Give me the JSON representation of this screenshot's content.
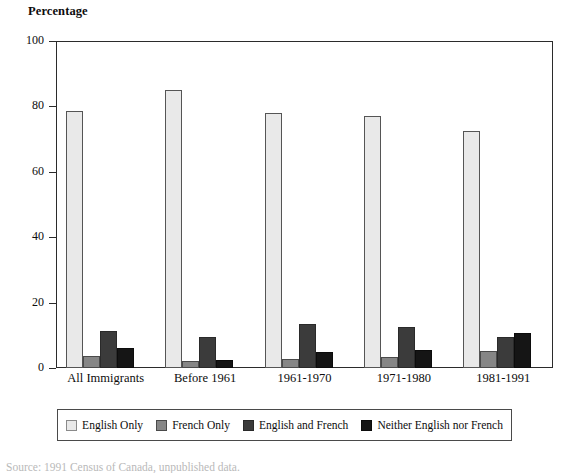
{
  "chart_data": {
    "type": "bar",
    "title": "",
    "ylabel": "Percentage",
    "xlabel": "",
    "ylim": [
      0,
      100
    ],
    "yticks": [
      0,
      20,
      40,
      60,
      80,
      100
    ],
    "grid": false,
    "legend_position": "bottom",
    "categories": [
      "All Immigrants",
      "Before 1961",
      "1961-1970",
      "1971-1980",
      "1981-1991"
    ],
    "series": [
      {
        "name": "English Only",
        "color": "#e9e9e9",
        "values": [
          78.5,
          85.0,
          78.0,
          77.0,
          72.5
        ]
      },
      {
        "name": "French Only",
        "color": "#868686",
        "values": [
          3.7,
          2.0,
          2.7,
          3.4,
          5.2
        ]
      },
      {
        "name": "English and French",
        "color": "#3b3b3b",
        "values": [
          11.3,
          9.5,
          13.5,
          12.6,
          9.5
        ]
      },
      {
        "name": "Neither English nor French",
        "color": "#151515",
        "values": [
          6.1,
          2.6,
          4.8,
          5.4,
          10.6
        ]
      }
    ]
  },
  "source_note": "Source: 1991 Census of Canada, unpublished data."
}
